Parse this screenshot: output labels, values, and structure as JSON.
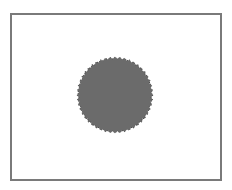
{
  "figure": {
    "frame": {
      "border_color": "#7a7a7a",
      "background": "#ffffff"
    },
    "shape": {
      "kind": "serrated-circle",
      "fill_color": "#6b6b6b",
      "edge_color": "#4a4a4a",
      "teeth": 48
    }
  }
}
